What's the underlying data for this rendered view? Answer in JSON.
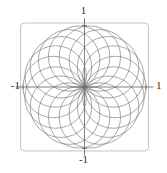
{
  "figure": {
    "title": "",
    "background_color": "#ffffff",
    "width": 167,
    "height": 173
  },
  "axis_labels": {
    "top": "1",
    "bottom": "-1",
    "left": "-1",
    "right": "1"
  },
  "chart_data": {
    "type": "line",
    "title": "",
    "subtitle": "",
    "xlabel": "",
    "ylabel": "",
    "xlim": [
      -1,
      1
    ],
    "ylim": [
      -1,
      1
    ],
    "xticks": [
      -1,
      1
    ],
    "yticks": [
      -1,
      1
    ],
    "xticklabels": [
      "-1",
      "1"
    ],
    "yticklabels": [
      "-1",
      "1"
    ],
    "grid": false,
    "legend": null,
    "legend_position": "none",
    "frame": {
      "visible": true,
      "style": "rounded-rectangle",
      "color": "#b5b5b5",
      "line_width": 0.8,
      "corner_radius": 0.06,
      "bounds": [
        -1.04,
        -1.04,
        1.04,
        1.04
      ]
    },
    "axes_lines": {
      "visible": true,
      "color": "#4a4a4a",
      "line_width": 0.7,
      "x_axis_extent": [
        -1.12,
        1.12
      ],
      "y_axis_extent": [
        -1.12,
        1.12
      ]
    },
    "series": [
      {
        "name": "circle-family",
        "kind": "parametric-circles",
        "count": 18,
        "radius": 0.5,
        "center_radius": 0.5,
        "color": "#6e6e6e",
        "line_width": 0.6,
        "center_angles_deg": [
          0,
          20,
          40,
          60,
          80,
          100,
          120,
          140,
          160,
          180,
          200,
          220,
          240,
          260,
          280,
          300,
          320,
          340
        ],
        "centers": [
          [
            0.5,
            0.0
          ],
          [
            0.47,
            0.171
          ],
          [
            0.383,
            0.321
          ],
          [
            0.25,
            0.433
          ],
          [
            0.087,
            0.492
          ],
          [
            -0.087,
            0.492
          ],
          [
            -0.25,
            0.433
          ],
          [
            -0.383,
            0.321
          ],
          [
            -0.47,
            0.171
          ],
          [
            -0.5,
            0.0
          ],
          [
            -0.47,
            -0.171
          ],
          [
            -0.383,
            -0.321
          ],
          [
            -0.25,
            -0.433
          ],
          [
            -0.087,
            -0.492
          ],
          [
            0.087,
            -0.492
          ],
          [
            0.25,
            -0.433
          ],
          [
            0.383,
            -0.321
          ],
          [
            0.47,
            -0.171
          ]
        ]
      }
    ]
  }
}
